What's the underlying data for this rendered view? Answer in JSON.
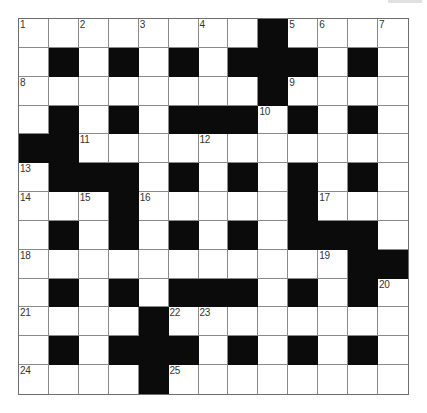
{
  "puzzle": {
    "rows": 13,
    "cols": 13,
    "colors": {
      "block": "#0b0b0b",
      "cell": "#ffffff",
      "gridline": "#8a8a8a",
      "number": "#333333"
    },
    "layout": [
      "........#....",
      ".#.#.#.###.#.",
      "........#....",
      ".#.#.###.#.#.",
      "##...........",
      ".###.#.#.#.#.",
      "...#.....#...",
      ".#.#.#.#.###.",
      "...........##",
      ".#.#.###.#.#.",
      "....#........",
      ".#.###.#.#.#.",
      "....#........"
    ],
    "numbers": [
      {
        "row": 0,
        "col": 0,
        "n": "1"
      },
      {
        "row": 0,
        "col": 2,
        "n": "2"
      },
      {
        "row": 0,
        "col": 4,
        "n": "3"
      },
      {
        "row": 0,
        "col": 6,
        "n": "4"
      },
      {
        "row": 0,
        "col": 9,
        "n": "5"
      },
      {
        "row": 0,
        "col": 10,
        "n": "6"
      },
      {
        "row": 0,
        "col": 12,
        "n": "7"
      },
      {
        "row": 2,
        "col": 0,
        "n": "8"
      },
      {
        "row": 2,
        "col": 9,
        "n": "9"
      },
      {
        "row": 3,
        "col": 8,
        "n": "10"
      },
      {
        "row": 4,
        "col": 2,
        "n": "11"
      },
      {
        "row": 4,
        "col": 6,
        "n": "12"
      },
      {
        "row": 5,
        "col": 0,
        "n": "13"
      },
      {
        "row": 6,
        "col": 0,
        "n": "14"
      },
      {
        "row": 6,
        "col": 2,
        "n": "15"
      },
      {
        "row": 6,
        "col": 4,
        "n": "16"
      },
      {
        "row": 6,
        "col": 10,
        "n": "17"
      },
      {
        "row": 8,
        "col": 0,
        "n": "18"
      },
      {
        "row": 8,
        "col": 10,
        "n": "19"
      },
      {
        "row": 9,
        "col": 12,
        "n": "20"
      },
      {
        "row": 10,
        "col": 0,
        "n": "21"
      },
      {
        "row": 10,
        "col": 5,
        "n": "22"
      },
      {
        "row": 10,
        "col": 6,
        "n": "23"
      },
      {
        "row": 12,
        "col": 0,
        "n": "24"
      },
      {
        "row": 12,
        "col": 5,
        "n": "25"
      }
    ]
  }
}
